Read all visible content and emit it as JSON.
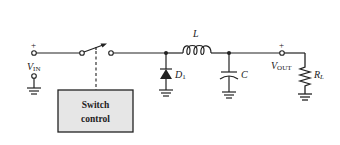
{
  "diagram": {
    "type": "buck-converter-schematic",
    "colors": {
      "wire": "#222222",
      "control_box_fill": "#e6e6e6",
      "background": "#ffffff"
    },
    "input": {
      "plus": "+",
      "label_main": "V",
      "label_sub": "IN"
    },
    "switch_control": {
      "line1": "Switch",
      "line2": "control"
    },
    "diode": {
      "label_main": "D",
      "label_sub": "1"
    },
    "inductor": {
      "label": "L"
    },
    "capacitor": {
      "label": "C"
    },
    "output": {
      "plus": "+",
      "label_main": "V",
      "label_sub": "OUT"
    },
    "load": {
      "label_main": "R",
      "label_sub": "L"
    }
  }
}
